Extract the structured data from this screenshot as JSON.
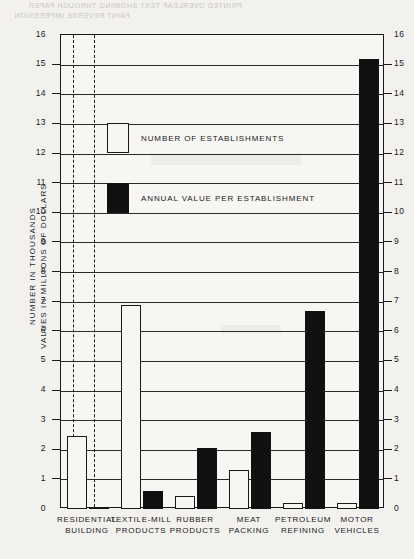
{
  "page": {
    "ghost_text_line1": "PRINTED OVERLEAF TEXT SHOWING THROUGH PAPER",
    "ghost_text_line2": "FAINT REVERSE IMPRESSION"
  },
  "axis": {
    "y_title_line1": "NUMBER IN THOUSANDS",
    "y_title_line2": "VALUES IN MILLIONS OF DOLLARS",
    "y_ticks": [
      "16",
      "15",
      "14",
      "13",
      "12",
      "11",
      "10",
      "9",
      "8",
      "7",
      "6",
      "5",
      "4",
      "3",
      "2",
      "1",
      "0"
    ]
  },
  "legend": {
    "items": [
      {
        "label": "NUMBER OF ESTABLISHMENTS",
        "style": "open",
        "color": "#f7f6f3"
      },
      {
        "label": "ANNUAL VALUE PER ESTABLISHMENT",
        "style": "solid",
        "color": "#111111"
      }
    ]
  },
  "chart_data": {
    "type": "bar",
    "title": "",
    "subtitle": "",
    "xlabel": "",
    "ylabel": "NUMBER IN THOUSANDS / VALUES IN MILLIONS OF DOLLARS",
    "ylim": [
      0,
      16
    ],
    "ytick_step": 1,
    "grid": true,
    "legend_position": "inside-upper-left",
    "categories": [
      "RESIDENTIAL BUILDING",
      "TEXTILE-MILL PRODUCTS",
      "RUBBER PRODUCTS",
      "MEAT PACKING",
      "PETROLEUM REFINING",
      "MOTOR VEHICLES"
    ],
    "category_lines": [
      [
        "RESIDENTIAL",
        "BUILDING"
      ],
      [
        "TEXTILE-MILL",
        "PRODUCTS"
      ],
      [
        "RUBBER",
        "PRODUCTS"
      ],
      [
        "MEAT",
        "PACKING"
      ],
      [
        "PETROLEUM",
        "REFINING"
      ],
      [
        "MOTOR",
        "VEHICLES"
      ]
    ],
    "series": [
      {
        "name": "NUMBER OF ESTABLISHMENTS",
        "style": "open",
        "values": [
          2.45,
          6.9,
          0.45,
          1.3,
          0.2,
          0.2
        ]
      },
      {
        "name": "ANNUAL VALUE PER ESTABLISHMENT",
        "style": "solid",
        "values": [
          0.05,
          0.6,
          2.05,
          2.6,
          6.7,
          15.2
        ]
      }
    ]
  }
}
